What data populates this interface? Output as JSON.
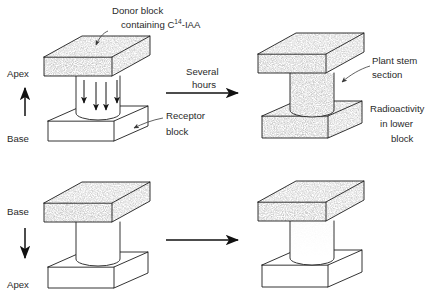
{
  "figure": {
    "type": "diagram",
    "background_color": "#ffffff",
    "ink_color": "#1a1a1a",
    "stipple_color": "#8d8d8d"
  },
  "annotations": {
    "donor_block_line1": "Donor block",
    "donor_block_line2_prefix": "containing C",
    "donor_block_line2_sup": "14",
    "donor_block_line2_suffix": "-IAA",
    "receptor_block_line1": "Receptor",
    "receptor_block_line2": "block",
    "plant_stem_line1": "Plant stem",
    "plant_stem_line2": "section",
    "radioactivity_line1": "Radioactivity",
    "radioactivity_line2": "in lower",
    "radioactivity_line3": "block"
  },
  "transition": {
    "top_label_line1": "Several",
    "top_label_line2": "hours",
    "bottom_label_line1": "",
    "bottom_label_line2": ""
  },
  "orientation": {
    "top_row": {
      "upper_label": "Apex",
      "lower_label": "Base",
      "arrow_direction": "up"
    },
    "bottom_row": {
      "upper_label": "Base",
      "lower_label": "Apex",
      "arrow_direction": "down"
    }
  },
  "panels": [
    {
      "id": "top-left",
      "position": "upper-left",
      "stem_orientation": "normal",
      "donor_block_labeled": true,
      "donor_block_stippled": true,
      "stem_stippled": false,
      "receptor_block_stippled": false,
      "internal_arrows": 4,
      "internal_arrow_direction": "down"
    },
    {
      "id": "top-right",
      "position": "upper-right",
      "stem_orientation": "normal",
      "donor_block_labeled": false,
      "donor_block_stippled": true,
      "stem_stippled": true,
      "receptor_block_stippled": true,
      "internal_arrows": 0,
      "internal_arrow_direction": ""
    },
    {
      "id": "bottom-left",
      "position": "lower-left",
      "stem_orientation": "inverted",
      "donor_block_labeled": false,
      "donor_block_stippled": true,
      "stem_stippled": false,
      "receptor_block_stippled": false,
      "internal_arrows": 0,
      "internal_arrow_direction": ""
    },
    {
      "id": "bottom-right",
      "position": "lower-right",
      "stem_orientation": "inverted",
      "donor_block_labeled": false,
      "donor_block_stippled": true,
      "stem_stippled": "partial-top",
      "receptor_block_stippled": false,
      "internal_arrows": 0,
      "internal_arrow_direction": ""
    }
  ]
}
